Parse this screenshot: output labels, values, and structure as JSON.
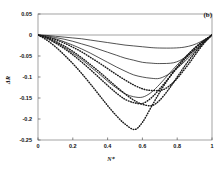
{
  "chart_data": {
    "type": "line",
    "title": "",
    "panel_label": "(b)",
    "xlabel": "N*",
    "ylabel": "ΔR",
    "xlim": [
      0,
      1
    ],
    "ylim": [
      -0.25,
      0.05
    ],
    "xticks": [
      "0",
      "0.2",
      "0.4",
      "0.6",
      "0.8",
      "1"
    ],
    "xtick_values": [
      0,
      0.2,
      0.4,
      0.6,
      0.8,
      1
    ],
    "yticks": [
      "0.05",
      "0",
      "-0.05",
      "-0.1",
      "-0.15",
      "-0.2",
      "-0.25"
    ],
    "ytick_values": [
      0.05,
      0,
      -0.05,
      -0.1,
      -0.15,
      -0.2,
      -0.25
    ],
    "grid": false,
    "legend": "none",
    "zero_line": true,
    "series": [
      {
        "name": "curve-1",
        "style": "dotted",
        "min_x": 0.555,
        "min_y": -0.225,
        "x": [
          0,
          0.05,
          0.1,
          0.15,
          0.2,
          0.25,
          0.3,
          0.35,
          0.4,
          0.45,
          0.5,
          0.555,
          0.6,
          0.65,
          0.7,
          0.75,
          0.8,
          0.85,
          0.9,
          0.95,
          1
        ],
        "values": [
          0,
          -0.012,
          -0.028,
          -0.047,
          -0.068,
          -0.091,
          -0.116,
          -0.142,
          -0.168,
          -0.192,
          -0.212,
          -0.225,
          -0.208,
          -0.172,
          -0.136,
          -0.104,
          -0.076,
          -0.052,
          -0.031,
          -0.014,
          0
        ]
      },
      {
        "name": "curve-2",
        "style": "dotted",
        "min_x": 0.6,
        "min_y": -0.163,
        "x": [
          0,
          0.05,
          0.1,
          0.15,
          0.2,
          0.25,
          0.3,
          0.35,
          0.4,
          0.45,
          0.5,
          0.55,
          0.6,
          0.65,
          0.7,
          0.75,
          0.8,
          0.85,
          0.9,
          0.95,
          1
        ],
        "values": [
          0,
          -0.008,
          -0.019,
          -0.032,
          -0.047,
          -0.064,
          -0.082,
          -0.101,
          -0.12,
          -0.138,
          -0.153,
          -0.161,
          -0.163,
          -0.15,
          -0.128,
          -0.103,
          -0.078,
          -0.055,
          -0.034,
          -0.016,
          0
        ]
      },
      {
        "name": "curve-3",
        "style": "dotted",
        "min_x": 0.655,
        "min_y": -0.168,
        "x": [
          0,
          0.05,
          0.1,
          0.15,
          0.2,
          0.25,
          0.3,
          0.35,
          0.4,
          0.45,
          0.5,
          0.55,
          0.6,
          0.655,
          0.7,
          0.75,
          0.8,
          0.85,
          0.9,
          0.95,
          1
        ],
        "values": [
          0,
          -0.006,
          -0.015,
          -0.026,
          -0.039,
          -0.054,
          -0.07,
          -0.087,
          -0.105,
          -0.123,
          -0.14,
          -0.155,
          -0.165,
          -0.168,
          -0.155,
          -0.13,
          -0.1,
          -0.07,
          -0.043,
          -0.019,
          0
        ]
      },
      {
        "name": "curve-4",
        "style": "dotted",
        "min_x": 0.72,
        "min_y": -0.132,
        "x": [
          0,
          0.05,
          0.1,
          0.15,
          0.2,
          0.25,
          0.3,
          0.35,
          0.4,
          0.45,
          0.5,
          0.55,
          0.6,
          0.65,
          0.72,
          0.78,
          0.83,
          0.88,
          0.92,
          0.96,
          1
        ],
        "values": [
          0,
          -0.005,
          -0.011,
          -0.019,
          -0.029,
          -0.04,
          -0.053,
          -0.066,
          -0.08,
          -0.094,
          -0.107,
          -0.119,
          -0.128,
          -0.132,
          -0.13,
          -0.112,
          -0.088,
          -0.061,
          -0.038,
          -0.017,
          0
        ]
      },
      {
        "name": "curve-5",
        "style": "solid",
        "min_x": 0.6,
        "min_y": -0.148,
        "x": [
          0,
          0.05,
          0.1,
          0.15,
          0.2,
          0.25,
          0.3,
          0.35,
          0.4,
          0.45,
          0.5,
          0.55,
          0.6,
          0.65,
          0.7,
          0.75,
          0.8,
          0.85,
          0.9,
          0.95,
          1
        ],
        "values": [
          0,
          -0.007,
          -0.017,
          -0.029,
          -0.043,
          -0.058,
          -0.075,
          -0.092,
          -0.11,
          -0.126,
          -0.14,
          -0.147,
          -0.148,
          -0.137,
          -0.117,
          -0.094,
          -0.071,
          -0.05,
          -0.031,
          -0.014,
          0
        ]
      },
      {
        "name": "curve-6",
        "style": "solid",
        "min_x": 0.7,
        "min_y": -0.103,
        "x": [
          0,
          0.05,
          0.1,
          0.15,
          0.2,
          0.25,
          0.3,
          0.35,
          0.4,
          0.45,
          0.5,
          0.55,
          0.6,
          0.65,
          0.7,
          0.76,
          0.82,
          0.87,
          0.92,
          0.96,
          1
        ],
        "values": [
          0,
          -0.004,
          -0.009,
          -0.016,
          -0.024,
          -0.033,
          -0.043,
          -0.054,
          -0.065,
          -0.076,
          -0.086,
          -0.095,
          -0.1,
          -0.103,
          -0.103,
          -0.091,
          -0.072,
          -0.052,
          -0.032,
          -0.015,
          0
        ]
      },
      {
        "name": "curve-7",
        "style": "solid",
        "min_x": 0.78,
        "min_y": -0.068,
        "x": [
          0,
          0.05,
          0.1,
          0.15,
          0.2,
          0.25,
          0.3,
          0.35,
          0.4,
          0.45,
          0.5,
          0.55,
          0.6,
          0.65,
          0.7,
          0.78,
          0.84,
          0.89,
          0.93,
          0.97,
          1
        ],
        "values": [
          0,
          -0.002,
          -0.006,
          -0.01,
          -0.015,
          -0.021,
          -0.027,
          -0.034,
          -0.041,
          -0.048,
          -0.055,
          -0.06,
          -0.065,
          -0.067,
          -0.068,
          -0.066,
          -0.055,
          -0.04,
          -0.026,
          -0.011,
          0
        ]
      },
      {
        "name": "curve-8",
        "style": "solid",
        "min_x": 0.84,
        "min_y": -0.031,
        "x": [
          0,
          0.05,
          0.1,
          0.15,
          0.2,
          0.25,
          0.3,
          0.35,
          0.4,
          0.45,
          0.5,
          0.55,
          0.6,
          0.65,
          0.7,
          0.78,
          0.84,
          0.89,
          0.93,
          0.97,
          1
        ],
        "values": [
          0,
          -0.001,
          -0.003,
          -0.005,
          -0.007,
          -0.009,
          -0.012,
          -0.015,
          -0.018,
          -0.021,
          -0.024,
          -0.026,
          -0.028,
          -0.03,
          -0.031,
          -0.031,
          -0.029,
          -0.024,
          -0.017,
          -0.008,
          0
        ]
      }
    ],
    "line_color": "#1a1a1a"
  }
}
